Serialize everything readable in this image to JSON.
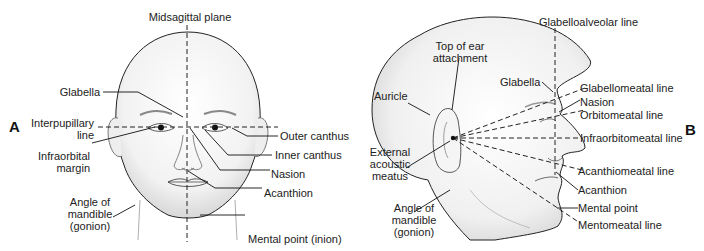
{
  "figure": {
    "panel_a": {
      "letter": "A",
      "labels": {
        "midsagittal_plane": "Midsagittal plane",
        "glabella": "Glabella",
        "interpupillary_line_1": "Interpupillary",
        "interpupillary_line_2": "line",
        "infraorbital_margin_1": "Infraorbital",
        "infraorbital_margin_2": "margin",
        "angle_of_mandible_1": "Angle of",
        "angle_of_mandible_2": "mandible",
        "angle_of_mandible_3": "(gonion)",
        "outer_canthus": "Outer canthus",
        "inner_canthus": "Inner canthus",
        "nasion": "Nasion",
        "acanthion": "Acanthion",
        "mental_point": "Mental point (inion)"
      }
    },
    "panel_b": {
      "letter": "B",
      "labels": {
        "glabelloalveolar_line": "Glabelloalveolar line",
        "top_of_ear_1": "Top of ear",
        "top_of_ear_2": "attachment",
        "auricle": "Auricle",
        "glabella": "Glabella",
        "glabellomeatal_line": "Glabellomeatal line",
        "nasion": "Nasion",
        "orbitomeatal_line": "Orbitomeatal line",
        "infraorbitomeatal_line": "Infraorbitomeatal line",
        "external_acoustic_meatus_1": "External",
        "external_acoustic_meatus_2": "acoustic",
        "external_acoustic_meatus_3": "meatus",
        "acanthiomeatal_line": "Acanthiomeatal line",
        "acanthion": "Acanthion",
        "angle_of_mandible_1": "Angle of",
        "angle_of_mandible_2": "mandible",
        "angle_of_mandible_3": "(gonion)",
        "mental_point": "Mental point",
        "mentomeatal_line": "Mentomeatal line"
      }
    }
  }
}
